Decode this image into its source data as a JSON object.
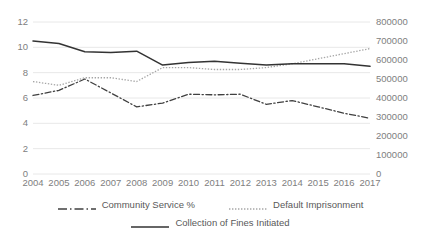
{
  "chart_data": {
    "type": "line",
    "title": "",
    "xlabel": "",
    "ylabel": "",
    "grid": true,
    "legend_position": "bottom",
    "categories": [
      "2004",
      "2005",
      "2006",
      "2007",
      "2008",
      "2009",
      "2010",
      "2011",
      "2012",
      "2013",
      "2014",
      "2015",
      "2016",
      "2017"
    ],
    "axes": {
      "left": {
        "ylim": [
          0,
          12
        ],
        "ticks": [
          0,
          2,
          4,
          6,
          8,
          10,
          12
        ],
        "tick_labels": [
          "0",
          "2",
          "4",
          "6",
          "8",
          "10",
          "12"
        ]
      },
      "right": {
        "ylim": [
          0,
          800000
        ],
        "ticks": [
          0,
          100000,
          200000,
          300000,
          400000,
          500000,
          600000,
          700000,
          800000
        ],
        "tick_labels": [
          "0",
          "100000",
          "200000",
          "300000",
          "400000",
          "500000",
          "600000",
          "700000",
          "800000"
        ]
      }
    },
    "series": [
      {
        "name": "Community Service %",
        "axis": "left",
        "style": "dash-dot",
        "color": "#404040",
        "values": [
          6.2,
          6.6,
          7.5,
          6.4,
          5.3,
          5.6,
          6.3,
          6.25,
          6.3,
          5.5,
          5.8,
          5.3,
          4.8,
          4.4
        ]
      },
      {
        "name": "Default Imprisonment",
        "axis": "right",
        "style": "dotted",
        "color": "#A6A6A6",
        "values": [
          7.3,
          7.0,
          7.6,
          7.6,
          7.3,
          8.4,
          8.4,
          8.25,
          8.25,
          8.4,
          8.7,
          9.1,
          9.5,
          9.9
        ]
      },
      {
        "name": "Collection of Fines Initiated",
        "axis": "right",
        "style": "solid",
        "color": "#333333",
        "values": [
          10.5,
          10.3,
          9.65,
          9.6,
          9.7,
          8.6,
          8.8,
          8.9,
          8.75,
          8.6,
          8.7,
          8.7,
          8.7,
          8.5
        ]
      }
    ]
  },
  "legend": {
    "items": [
      {
        "label": "Community Service %"
      },
      {
        "label": "Default Imprisonment"
      },
      {
        "label": "Collection of Fines Initiated"
      }
    ]
  }
}
